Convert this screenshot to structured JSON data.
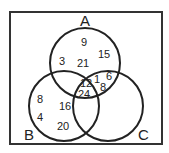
{
  "diagram": {
    "type": "venn-3",
    "sets": [
      {
        "label": "A"
      },
      {
        "label": "B"
      },
      {
        "label": "C"
      }
    ],
    "regions": {
      "A_only": [
        "9",
        "15",
        "3",
        "21"
      ],
      "A_and_C_only": [
        "1",
        "6",
        "8"
      ],
      "A_and_B_and_C": [
        "12",
        "24"
      ],
      "B_only": [
        "8",
        "4",
        "16",
        "20"
      ]
    },
    "colors": {
      "stroke": "#222222",
      "background": "#ffffff"
    }
  }
}
